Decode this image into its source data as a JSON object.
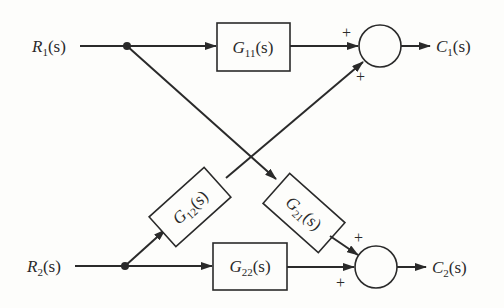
{
  "diagram": {
    "type": "block-diagram",
    "inputs": [
      {
        "id": "R1",
        "letter": "R",
        "sub": "1",
        "arg": "(s)"
      },
      {
        "id": "R2",
        "letter": "R",
        "sub": "2",
        "arg": "(s)"
      }
    ],
    "outputs": [
      {
        "id": "C1",
        "letter": "C",
        "sub": "1",
        "arg": "(s)"
      },
      {
        "id": "C2",
        "letter": "C",
        "sub": "2",
        "arg": "(s)"
      }
    ],
    "blocks": [
      {
        "id": "G11",
        "letter": "G",
        "sub": "11",
        "arg": "(s)",
        "from": "R1",
        "to": "sum1"
      },
      {
        "id": "G12",
        "letter": "G",
        "sub": "12",
        "arg": "(s)",
        "from": "R2",
        "to": "sum1"
      },
      {
        "id": "G21",
        "letter": "G",
        "sub": "21",
        "arg": "(s)",
        "from": "R1",
        "to": "sum2"
      },
      {
        "id": "G22",
        "letter": "G",
        "sub": "22",
        "arg": "(s)",
        "from": "R2",
        "to": "sum2"
      }
    ],
    "summing_junctions": [
      {
        "id": "sum1",
        "signs": {
          "top": "+",
          "bottom": "+"
        },
        "output": "C1"
      },
      {
        "id": "sum2",
        "signs": {
          "top": "+",
          "bottom": "+"
        },
        "output": "C2"
      }
    ],
    "colors": {
      "ink": "#2a2a2a",
      "paper": "#fdfdfb"
    }
  }
}
